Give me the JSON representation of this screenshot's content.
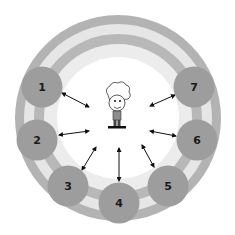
{
  "diagram": {
    "center": {
      "x": 118,
      "y": 118
    },
    "colors": {
      "band_dark": "#b3b3b3",
      "band_light": "#e6e6e6",
      "inner": "#ffffff",
      "node": "#9d9d9d",
      "arrow": "#111111"
    },
    "rings": [
      103,
      94,
      84,
      74,
      61
    ],
    "center_figure": "cartoon-boy-icon",
    "nodes": [
      {
        "label": "1",
        "x": 42,
        "y": 87
      },
      {
        "label": "2",
        "x": 37,
        "y": 140
      },
      {
        "label": "3",
        "x": 68,
        "y": 186
      },
      {
        "label": "4",
        "x": 119,
        "y": 203
      },
      {
        "label": "5",
        "x": 168,
        "y": 186
      },
      {
        "label": "6",
        "x": 197,
        "y": 140
      },
      {
        "label": "7",
        "x": 194,
        "y": 87
      }
    ],
    "arrows": [
      {
        "from": "1",
        "x1": 62,
        "y1": 93,
        "x2": 89,
        "y2": 107
      },
      {
        "from": "2",
        "x1": 59,
        "y1": 135,
        "x2": 89,
        "y2": 131
      },
      {
        "from": "3",
        "x1": 82,
        "y1": 170,
        "x2": 96,
        "y2": 147
      },
      {
        "from": "4",
        "x1": 119,
        "y1": 181,
        "x2": 119,
        "y2": 148
      },
      {
        "from": "5",
        "x1": 154,
        "y1": 167,
        "x2": 142,
        "y2": 145
      },
      {
        "from": "6",
        "x1": 176,
        "y1": 136,
        "x2": 150,
        "y2": 131
      },
      {
        "from": "7",
        "x1": 175,
        "y1": 95,
        "x2": 150,
        "y2": 106
      }
    ]
  }
}
